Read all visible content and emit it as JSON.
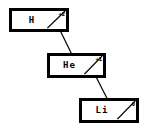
{
  "diagram": {
    "type": "staircase-node-diagram",
    "background_color": "#ffffff",
    "stroke_color": "#000000",
    "nodes": [
      {
        "id": "hydrogen",
        "symbol": "H",
        "charge": "+2",
        "box": {
          "x": 10,
          "y": 9,
          "width": 58,
          "height": 22
        }
      },
      {
        "id": "helium",
        "symbol": "He",
        "charge": "+1",
        "box": {
          "x": 48,
          "y": 54,
          "width": 57,
          "height": 23
        }
      },
      {
        "id": "lithium",
        "symbol": "Li",
        "charge": "0",
        "box": {
          "x": 80,
          "y": 99,
          "width": 58,
          "height": 23
        }
      }
    ],
    "edges": [
      {
        "id": "edge-h-he",
        "from": "hydrogen",
        "to": "helium",
        "x1": 55,
        "y1": 21,
        "x2": 76,
        "y2": 66
      },
      {
        "id": "edge-he-li",
        "from": "helium",
        "to": "lithium",
        "x1": 90,
        "y1": 66,
        "x2": 112,
        "y2": 111
      }
    ]
  }
}
